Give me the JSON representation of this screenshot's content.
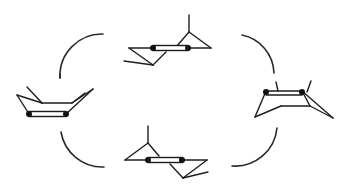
{
  "diagram": {
    "title": "",
    "colors": {
      "line": "#1e1e1e",
      "background": "#ffffff",
      "atom": "#111111"
    },
    "nodes": [
      {
        "id": "top",
        "label": "",
        "position": "top-center"
      },
      {
        "id": "right",
        "label": "",
        "position": "right"
      },
      {
        "id": "bottom",
        "label": "",
        "position": "bottom-center"
      },
      {
        "id": "left",
        "label": "",
        "position": "left"
      }
    ],
    "connectors": [
      {
        "from": "left",
        "to": "top",
        "shape": "arc"
      },
      {
        "from": "top",
        "to": "right",
        "shape": "arc"
      },
      {
        "from": "right",
        "to": "bottom",
        "shape": "arc"
      },
      {
        "from": "bottom",
        "to": "left",
        "shape": "arc"
      }
    ]
  }
}
